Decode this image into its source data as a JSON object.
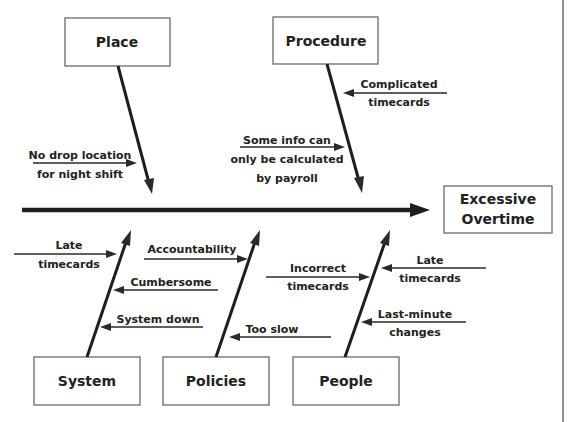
{
  "diagram": {
    "type": "fishbone (Ishikawa) cause-and-effect diagram",
    "effect": {
      "line1": "Excessive",
      "line2": "Overtime"
    },
    "categories": {
      "place": {
        "label": "Place",
        "causes": [
          {
            "line1": "No drop location",
            "line2": "for night shift"
          }
        ]
      },
      "procedure": {
        "label": "Procedure",
        "causes": [
          {
            "line1": "Complicated",
            "line2": "timecards"
          },
          {
            "line1": "Some info can",
            "line2": "only be calculated",
            "line3": "by payroll"
          }
        ]
      },
      "system": {
        "label": "System",
        "causes": [
          {
            "line1": "Late",
            "line2": "timecards"
          },
          {
            "line1": "Cumbersome"
          },
          {
            "line1": "System down"
          }
        ]
      },
      "policies": {
        "label": "Policies",
        "causes": [
          {
            "line1": "Accountability"
          },
          {
            "line1": "Too slow"
          }
        ]
      },
      "people": {
        "label": "People",
        "causes": [
          {
            "line1": "Incorrect",
            "line2": "timecards"
          },
          {
            "line1": "Late",
            "line2": "timecards"
          },
          {
            "line1": "Last-minute",
            "line2": "changes"
          }
        ]
      }
    },
    "colors": {
      "line": "#1e1e1e",
      "box_border": "#6a6a6a",
      "text": "#222222",
      "background": "#ffffff"
    }
  }
}
